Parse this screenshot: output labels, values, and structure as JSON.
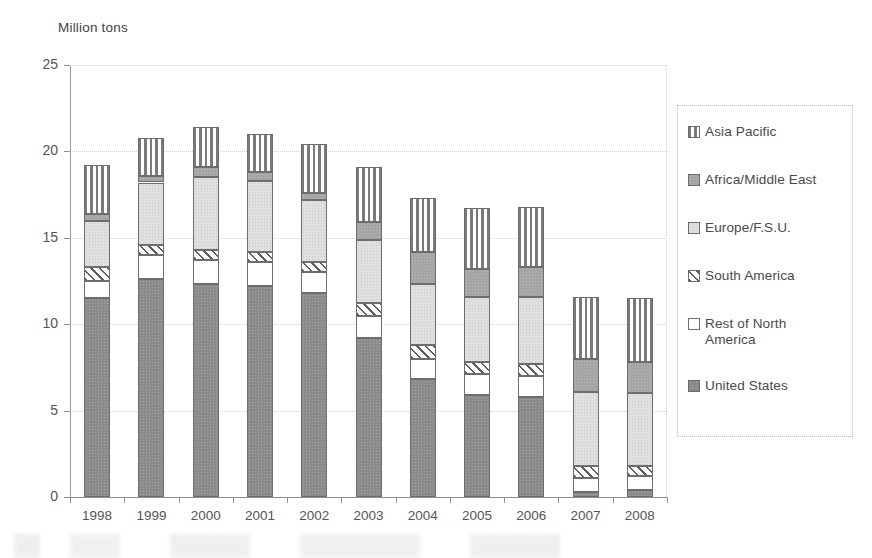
{
  "chart_data": {
    "type": "bar",
    "subtype": "stacked-vertical",
    "title": "",
    "ylabel": "Million tons",
    "xlabel": "",
    "ylim": [
      0,
      25
    ],
    "yticks": [
      0,
      5,
      10,
      15,
      20,
      25
    ],
    "grid": "horizontal-dotted",
    "legend_position": "right",
    "categories": [
      "1998",
      "1999",
      "2000",
      "2001",
      "2002",
      "2003",
      "2004",
      "2005",
      "2006",
      "2007",
      "2008"
    ],
    "series": [
      {
        "name": "United States",
        "swatch": "solid-dark-gray",
        "values": [
          11.5,
          12.6,
          12.3,
          12.2,
          11.8,
          9.2,
          6.8,
          5.9,
          5.8,
          0.3,
          0.4
        ]
      },
      {
        "name": "Rest of North America",
        "swatch": "white",
        "values": [
          1.0,
          1.4,
          1.4,
          1.4,
          1.2,
          1.3,
          1.2,
          1.2,
          1.2,
          0.8,
          0.8
        ]
      },
      {
        "name": "South America",
        "swatch": "diagonal-hatch",
        "values": [
          0.8,
          0.6,
          0.6,
          0.6,
          0.6,
          0.7,
          0.8,
          0.7,
          0.7,
          0.7,
          0.6
        ]
      },
      {
        "name": "Europe/F.S.U.",
        "swatch": "light-gray-dotted",
        "values": [
          2.7,
          3.6,
          4.2,
          4.1,
          3.6,
          3.7,
          3.5,
          3.8,
          3.9,
          4.3,
          4.2
        ]
      },
      {
        "name": "Africa/Middle East",
        "swatch": "medium-gray",
        "values": [
          0.4,
          0.4,
          0.6,
          0.5,
          0.4,
          1.0,
          1.9,
          1.6,
          1.7,
          1.9,
          1.8
        ]
      },
      {
        "name": "Asia Pacific",
        "swatch": "vertical-stripes",
        "values": [
          2.8,
          2.2,
          2.3,
          2.2,
          2.8,
          3.2,
          3.1,
          3.5,
          3.5,
          3.6,
          3.7
        ]
      }
    ],
    "totals": [
      19.2,
      20.8,
      21.4,
      21.0,
      20.4,
      19.1,
      17.3,
      16.7,
      16.8,
      11.6,
      11.5
    ]
  },
  "axis": {
    "y_title": "Million tons",
    "y_tick_labels": [
      "25",
      "20",
      "15",
      "10",
      "5",
      "0"
    ],
    "x_tick_labels": [
      "1998",
      "1999",
      "2000",
      "2001",
      "2002",
      "2003",
      "2004",
      "2005",
      "2006",
      "2007",
      "2008"
    ]
  },
  "legend": {
    "items": [
      {
        "label": "Asia Pacific",
        "swatch": "vertical-stripes"
      },
      {
        "label": "Africa/Middle East",
        "swatch": "medium-gray"
      },
      {
        "label": "Europe/F.S.U.",
        "swatch": "light-gray-dotted"
      },
      {
        "label": "South America",
        "swatch": "diagonal-hatch"
      },
      {
        "label": "Rest of North\nAmerica",
        "swatch": "white"
      },
      {
        "label": "United States",
        "swatch": "solid-dark-gray"
      }
    ]
  },
  "colors": {
    "united_states": "#8b8b8b",
    "rest_of_north_america": "#ffffff",
    "south_america": "#5e5e5e",
    "europe_fsu": "#e0e0e0",
    "africa_middle_east": "#a5a5a5",
    "asia_pacific": "#7a7a7a",
    "axis": "#8f8f8f",
    "grid": "#d2d2d2",
    "text": "#4a4a4a"
  }
}
